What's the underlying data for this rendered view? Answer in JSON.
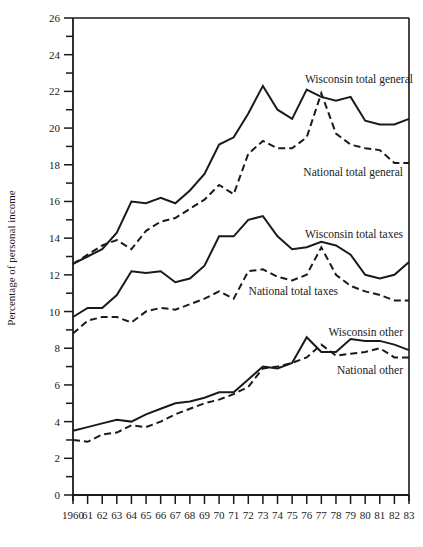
{
  "chart_data": {
    "type": "line",
    "title": "",
    "xlabel": "",
    "ylabel": "Percentage of personal income",
    "ylim": [
      0,
      26
    ],
    "yticks": [
      0,
      2,
      4,
      6,
      8,
      10,
      12,
      14,
      16,
      18,
      20,
      22,
      24,
      26
    ],
    "yminor_step": 1,
    "grid": false,
    "legend": "inline labels",
    "x": [
      1960,
      1961,
      1962,
      1963,
      1964,
      1965,
      1966,
      1967,
      1968,
      1969,
      1970,
      1971,
      1972,
      1973,
      1974,
      1975,
      1976,
      1977,
      1978,
      1979,
      1980,
      1981,
      1982,
      1983
    ],
    "xtick_labels": [
      "1960",
      "61",
      "62",
      "63",
      "64",
      "65",
      "66",
      "67",
      "68",
      "69",
      "70",
      "71",
      "72",
      "73",
      "74",
      "75",
      "76",
      "77",
      "78",
      "79",
      "80",
      "81",
      "82",
      "83"
    ],
    "series": [
      {
        "name": "Wisconsin total general",
        "style": "solid",
        "values": [
          12.6,
          13.0,
          13.4,
          14.3,
          16.0,
          15.9,
          16.2,
          15.9,
          16.6,
          17.5,
          19.1,
          19.5,
          20.8,
          22.3,
          21.0,
          20.5,
          22.1,
          21.7,
          21.5,
          21.7,
          20.4,
          20.2,
          20.2,
          20.5
        ],
        "label_pos": {
          "x": 413,
          "y": 83
        }
      },
      {
        "name": "National total general",
        "style": "dashed",
        "values": [
          12.6,
          13.1,
          13.6,
          13.9,
          13.4,
          14.4,
          14.9,
          15.1,
          15.6,
          16.1,
          16.9,
          16.4,
          18.6,
          19.3,
          18.9,
          18.9,
          19.5,
          21.9,
          19.7,
          19.1,
          18.9,
          18.8,
          18.1,
          18.1
        ],
        "label_pos": {
          "x": 403,
          "y": 176
        }
      },
      {
        "name": "Wisconsin total taxes",
        "style": "solid",
        "values": [
          9.7,
          10.2,
          10.2,
          10.9,
          12.2,
          12.1,
          12.2,
          11.6,
          11.8,
          12.5,
          14.1,
          14.1,
          15.0,
          15.2,
          14.1,
          13.4,
          13.5,
          13.8,
          13.6,
          13.1,
          12.0,
          11.8,
          12.0,
          12.7
        ],
        "label_pos": {
          "x": 403,
          "y": 238
        }
      },
      {
        "name": "National total taxes",
        "style": "dashed",
        "values": [
          8.8,
          9.5,
          9.7,
          9.7,
          9.4,
          10.0,
          10.2,
          10.1,
          10.4,
          10.7,
          11.1,
          10.7,
          12.2,
          12.3,
          11.9,
          11.7,
          12.0,
          13.5,
          12.0,
          11.4,
          11.1,
          10.9,
          10.6,
          10.6
        ],
        "label_pos": {
          "x": 338,
          "y": 295
        }
      },
      {
        "name": "Wisconsin other",
        "style": "solid",
        "values": [
          3.5,
          3.7,
          3.9,
          4.1,
          4.0,
          4.4,
          4.7,
          5.0,
          5.1,
          5.3,
          5.6,
          5.6,
          6.3,
          7.0,
          6.9,
          7.2,
          8.6,
          7.8,
          7.8,
          8.5,
          8.4,
          8.4,
          8.2,
          7.9
        ],
        "label_pos": {
          "x": 403,
          "y": 336
        }
      },
      {
        "name": "National other",
        "style": "dashed",
        "values": [
          3.0,
          2.9,
          3.3,
          3.4,
          3.8,
          3.7,
          4.0,
          4.4,
          4.7,
          5.0,
          5.2,
          5.5,
          5.9,
          6.9,
          7.0,
          7.2,
          7.5,
          8.2,
          7.6,
          7.7,
          7.8,
          8.0,
          7.5,
          7.5
        ],
        "label_pos": {
          "x": 403,
          "y": 374
        }
      }
    ]
  },
  "colors": {
    "ink": "#1a1a1a",
    "background": "#ffffff"
  }
}
